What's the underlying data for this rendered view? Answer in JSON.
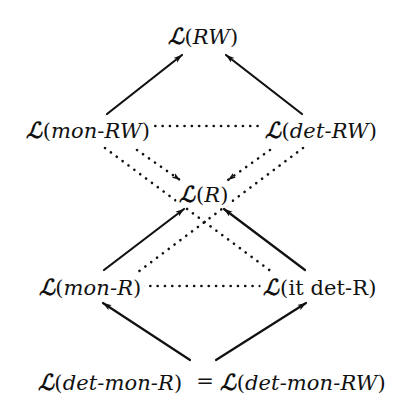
{
  "figure": {
    "background_color": "#ffffff",
    "ink_color": "#111111",
    "width": 406,
    "height": 412
  },
  "symbols": {
    "script_l": "ℒ",
    "open_paren": "(",
    "close_paren": ")",
    "equals": "="
  },
  "nodes": [
    {
      "id": "rw",
      "label": "ℒ(RW)",
      "arg": "RW",
      "arg_style": "italic",
      "x": 203,
      "y": 36
    },
    {
      "id": "mon-rw",
      "label": "ℒ(mon-RW)",
      "arg": "mon-RW",
      "arg_style": "italic",
      "x": 88,
      "y": 130
    },
    {
      "id": "det-rw",
      "label": "ℒ(det-RW)",
      "arg": "det-RW",
      "arg_style": "italic",
      "x": 321,
      "y": 130
    },
    {
      "id": "r",
      "label": "ℒ(R)",
      "arg": "R",
      "arg_style": "italic",
      "x": 204,
      "y": 194
    },
    {
      "id": "mon-r",
      "label": "ℒ(mon-R)",
      "arg": "mon-R",
      "arg_style": "italic",
      "x": 90,
      "y": 287
    },
    {
      "id": "it-det-r",
      "label": "ℒ(it det-R)",
      "arg": "it det-R",
      "arg_style": "roman",
      "x": 320,
      "y": 287
    },
    {
      "id": "det-mon-r",
      "label": "ℒ(det-mon-R)",
      "arg": "det-mon-R",
      "arg_style": "italic",
      "x": 110,
      "y": 382
    },
    {
      "id": "det-mon-rw",
      "label": "ℒ(det-mon-RW)",
      "arg": "det-mon-RW",
      "arg_style": "italic",
      "x": 303,
      "y": 382
    }
  ],
  "bottom_relation": {
    "left": "ℒ(det-mon-R)",
    "operator": "=",
    "right": "ℒ(det-mon-RW)"
  },
  "edges": [
    {
      "id": "mon-rw-to-rw",
      "from": "mon-rw",
      "to": "rw",
      "style": "solid",
      "arrow": "end",
      "meaning": "strict-inclusion",
      "x1": 107,
      "y1": 114,
      "x2": 182,
      "y2": 55
    },
    {
      "id": "det-rw-to-rw",
      "from": "det-rw",
      "to": "rw",
      "style": "solid",
      "arrow": "end",
      "meaning": "strict-inclusion",
      "x1": 302,
      "y1": 114,
      "x2": 226,
      "y2": 55
    },
    {
      "id": "mon-rw-to-det-rw",
      "from": "mon-rw",
      "to": "det-rw",
      "style": "dotted",
      "arrow": "none",
      "meaning": "incomparable",
      "x1": 148,
      "y1": 126,
      "x2": 262,
      "y2": 126
    },
    {
      "id": "mon-rw-to-r",
      "from": "mon-rw",
      "to": "r",
      "style": "dotted",
      "arrow": "end",
      "meaning": "strict-inclusion",
      "x1": 137,
      "y1": 150,
      "x2": 180,
      "y2": 180
    },
    {
      "id": "det-rw-to-r",
      "from": "det-rw",
      "to": "r",
      "style": "dotted",
      "arrow": "end",
      "meaning": "strict-inclusion",
      "x1": 270,
      "y1": 150,
      "x2": 228,
      "y2": 180
    },
    {
      "id": "mon-rw-to-it-det-r",
      "from": "mon-rw",
      "to": "it-det-r",
      "style": "dotted",
      "arrow": "none",
      "meaning": "incomparable",
      "x1": 105,
      "y1": 148,
      "x2": 272,
      "y2": 272
    },
    {
      "id": "det-rw-to-mon-r",
      "from": "det-rw",
      "to": "mon-r",
      "style": "dotted",
      "arrow": "none",
      "meaning": "incomparable",
      "x1": 303,
      "y1": 148,
      "x2": 138,
      "y2": 272
    },
    {
      "id": "mon-r-to-r",
      "from": "mon-r",
      "to": "r",
      "style": "solid",
      "arrow": "end",
      "meaning": "strict-inclusion",
      "x1": 104,
      "y1": 270,
      "x2": 184,
      "y2": 209
    },
    {
      "id": "it-det-r-to-r",
      "from": "it-det-r",
      "to": "r",
      "style": "solid",
      "arrow": "end",
      "meaning": "strict-inclusion",
      "x1": 305,
      "y1": 270,
      "x2": 224,
      "y2": 209
    },
    {
      "id": "mon-r-to-it-det-r",
      "from": "mon-r",
      "to": "it-det-r",
      "style": "dotted",
      "arrow": "none",
      "meaning": "incomparable",
      "x1": 143,
      "y1": 286,
      "x2": 265,
      "y2": 286
    },
    {
      "id": "bottom-to-mon-r",
      "from": "det-mon-r",
      "to": "mon-r",
      "style": "solid",
      "arrow": "end",
      "meaning": "strict-inclusion",
      "x1": 190,
      "y1": 360,
      "x2": 103,
      "y2": 303
    },
    {
      "id": "bottom-to-it-det-r",
      "from": "det-mon-rw",
      "to": "it-det-r",
      "style": "solid",
      "arrow": "end",
      "meaning": "strict-inclusion",
      "x1": 216,
      "y1": 360,
      "x2": 306,
      "y2": 303
    }
  ],
  "legend": {
    "solid_meaning": "strict inclusion",
    "dotted_meaning": "incomparable classes"
  }
}
